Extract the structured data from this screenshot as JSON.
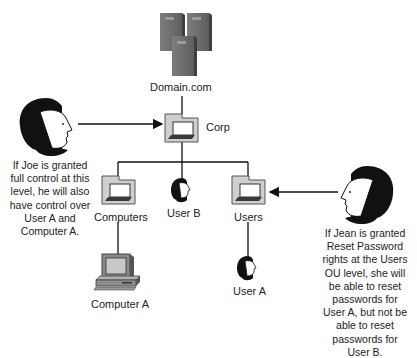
{
  "diagram": {
    "nodes": {
      "domain": {
        "label": "Domain.com",
        "icon": "server-cluster-icon"
      },
      "corp": {
        "label": "Corp",
        "icon": "ou-folder-icon"
      },
      "computers": {
        "label": "Computers",
        "icon": "ou-folder-icon"
      },
      "user_b": {
        "label": "User B",
        "icon": "user-icon"
      },
      "users": {
        "label": "Users",
        "icon": "ou-folder-icon"
      },
      "computer_a": {
        "label": "Computer A",
        "icon": "desktop-computer-icon"
      },
      "user_a": {
        "label": "User A",
        "icon": "user-icon"
      }
    },
    "actors": {
      "joe": {
        "icon": "person-icon",
        "caption_lines": [
          "If Joe is granted",
          "full control at this",
          "level, he will also",
          "have control over",
          "User A and",
          "Computer A."
        ]
      },
      "jean": {
        "icon": "person-icon",
        "caption_lines": [
          "If Jean is granted",
          "Reset Password",
          "rights at the Users",
          "OU level, she will",
          "be able to reset",
          "passwords for",
          "User A, but not be",
          "able to reset",
          "passwords for",
          "User B."
        ]
      }
    },
    "edges": [
      [
        "domain",
        "corp"
      ],
      [
        "corp",
        "computers"
      ],
      [
        "corp",
        "user_b"
      ],
      [
        "corp",
        "users"
      ],
      [
        "computers",
        "computer_a"
      ],
      [
        "users",
        "user_a"
      ]
    ],
    "arrows": [
      {
        "from": "joe",
        "to": "corp"
      },
      {
        "from": "jean",
        "to": "users"
      }
    ]
  }
}
